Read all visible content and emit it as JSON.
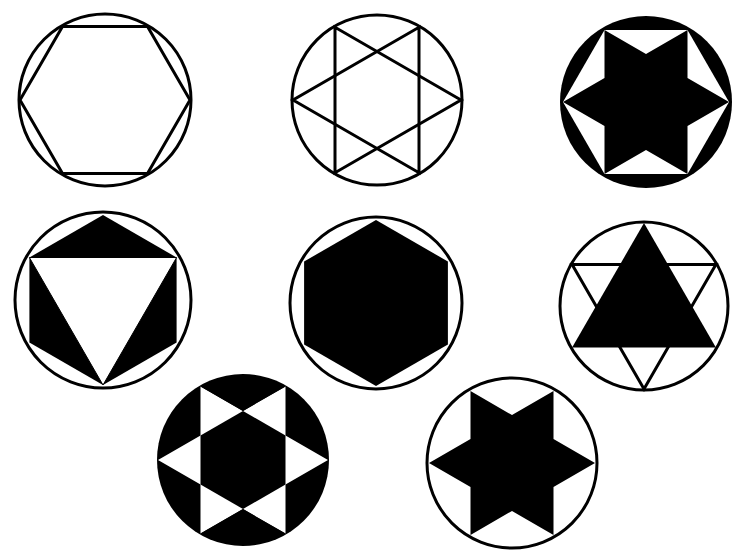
{
  "colors": {
    "ink": "#000000",
    "paper": "#ffffff"
  },
  "figures": [
    {
      "id": "fig-1",
      "name": "outline-hexagon-in-circle",
      "description": "Hexagon outline inscribed in circle (flat top)"
    },
    {
      "id": "fig-2",
      "name": "outline-hexagram-in-circle",
      "description": "Two overlapping triangles outline (six-pointed star), pointing left/right"
    },
    {
      "id": "fig-3",
      "name": "solid-star-black-segments",
      "description": "Solid six-pointed star, white hexagon triangles, black circle segments"
    },
    {
      "id": "fig-4",
      "name": "inverted-triangle-black-wedges",
      "description": "White inverted triangle with black triangles filling to hexagon"
    },
    {
      "id": "fig-5",
      "name": "solid-hexagon-in-circle",
      "description": "Solid black hexagon inscribed in circle (pointy top)"
    },
    {
      "id": "fig-6",
      "name": "solid-triangle-in-star",
      "description": "Upward solid triangle with outline downward triangle"
    },
    {
      "id": "fig-7",
      "name": "solid-disc-white-star-points",
      "description": "Black disc with white star-point triangles and black center hexagon"
    },
    {
      "id": "fig-8",
      "name": "solid-star-in-circle",
      "description": "Solid six-pointed star in circle outline"
    }
  ]
}
